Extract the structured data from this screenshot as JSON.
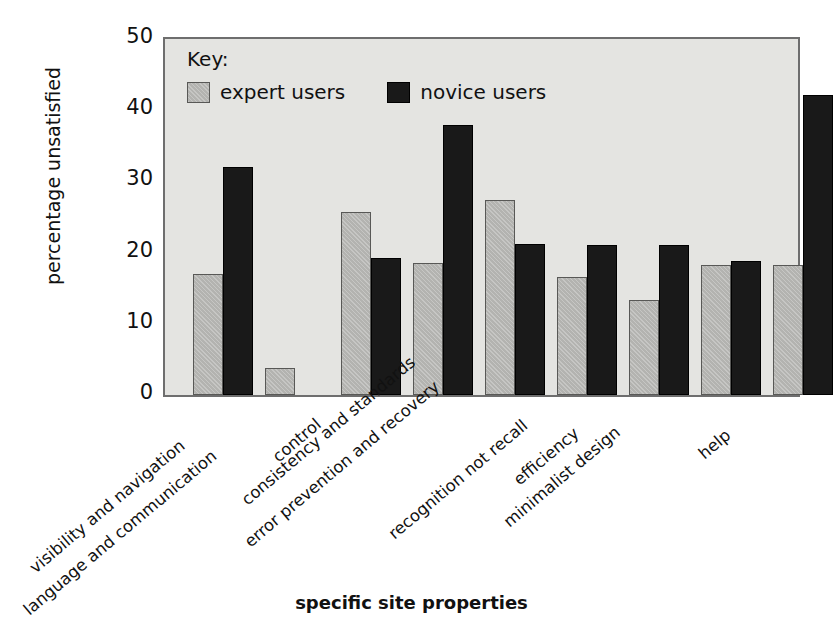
{
  "chart_data": {
    "type": "bar",
    "title": "",
    "xlabel": "specific site properties",
    "ylabel": "percentage unsatisfied",
    "ylim": [
      0,
      50
    ],
    "yticks": [
      0,
      10,
      20,
      30,
      40,
      50
    ],
    "grid": false,
    "legend_position": "top-left inside plot",
    "legend_title": "Key:",
    "categories": [
      "visibility and navigation",
      "language and communication",
      "control",
      "consistency and standards",
      "error prevention and recovery",
      "recognition not recall",
      "efficiency",
      "minimalist design",
      "help"
    ],
    "series": [
      {
        "name": "expert users",
        "color": "#b3b3b0",
        "values": [
          17.0,
          3.8,
          25.7,
          18.6,
          27.4,
          16.6,
          13.3,
          18.3,
          18.3
        ]
      },
      {
        "name": "novice users",
        "color": "#191919",
        "values": [
          32.0,
          null,
          19.2,
          37.9,
          21.2,
          21.1,
          21.0,
          18.8,
          42.1
        ]
      }
    ]
  },
  "axis": {
    "y_label": "percentage unsatisfied",
    "x_label": "specific site properties",
    "y_tick_labels": [
      "50",
      "40",
      "30",
      "20",
      "10",
      "0"
    ]
  },
  "legend": {
    "title": "Key:",
    "entries": [
      {
        "label": "expert users",
        "swatch": "expert"
      },
      {
        "label": "novice users",
        "swatch": "novice"
      }
    ]
  }
}
